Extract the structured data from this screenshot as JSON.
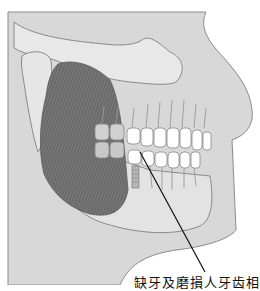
{
  "figure": {
    "callout_label": "缺牙及磨損人牙齿相",
    "colors": {
      "background": "#ffffff",
      "skin": "#d9d9d9",
      "bone": "#e6e6e6",
      "outline": "#8a8a8a",
      "muscle": "#6e6e6e",
      "teeth_back": "#cfcfcf",
      "teeth_front": "#ffffff",
      "pointer": "#111111"
    }
  }
}
